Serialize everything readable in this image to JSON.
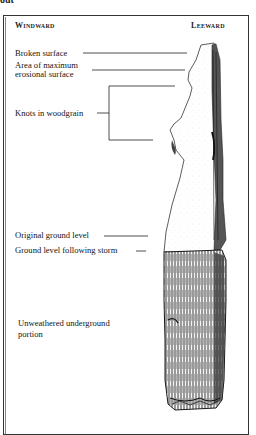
{
  "page_fragment": "out",
  "diagram": {
    "headings": {
      "left": "Windward",
      "right": "Leeward"
    },
    "labels": {
      "broken_surface": "Broken surface",
      "max_erosion_line1": "Area of maximum",
      "max_erosion_line2": "erosional surface",
      "knots": "Knots in woodgrain",
      "original_ground": "Original ground level",
      "ground_after_storm": "Ground level following storm",
      "unweathered_line1": "Unweathered underground",
      "unweathered_line2": "portion"
    }
  }
}
